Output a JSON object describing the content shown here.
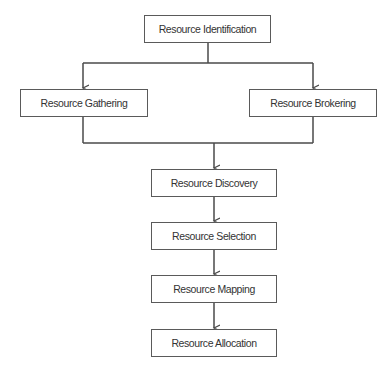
{
  "diagram": {
    "type": "flowchart",
    "colors": {
      "border": "#5a5a5a",
      "line": "#4a4a4a",
      "text": "#333333",
      "background": "#ffffff"
    },
    "nodes": [
      {
        "id": "identification",
        "label": "Resource Identification"
      },
      {
        "id": "gathering",
        "label": "Resource Gathering"
      },
      {
        "id": "brokering",
        "label": "Resource Brokering"
      },
      {
        "id": "discovery",
        "label": "Resource Discovery"
      },
      {
        "id": "selection",
        "label": "Resource Selection"
      },
      {
        "id": "mapping",
        "label": "Resource Mapping"
      },
      {
        "id": "allocation",
        "label": "Resource Allocation"
      }
    ],
    "edges": [
      {
        "from": "identification",
        "to": "gathering"
      },
      {
        "from": "identification",
        "to": "brokering"
      },
      {
        "from": "gathering",
        "to": "discovery"
      },
      {
        "from": "brokering",
        "to": "discovery"
      },
      {
        "from": "discovery",
        "to": "selection"
      },
      {
        "from": "selection",
        "to": "mapping"
      },
      {
        "from": "mapping",
        "to": "allocation"
      }
    ]
  }
}
